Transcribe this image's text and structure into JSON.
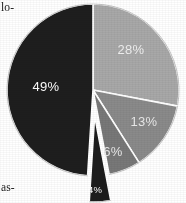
{
  "chart_data": {
    "type": "pie",
    "title": "",
    "subtitle": "",
    "xlabel": "",
    "ylabel": "",
    "legend": "none",
    "grid": false,
    "center": {
      "x": 93,
      "y": 90
    },
    "radius": 86,
    "start_angle_deg": 0,
    "direction": "clockwise",
    "labels": [
      "28%",
      "13%",
      "6%",
      "4%",
      "49%"
    ],
    "values": [
      28,
      13,
      6,
      4,
      49
    ],
    "categories": [
      "28%",
      "13%",
      "6%",
      "4%",
      "49%"
    ],
    "slices": [
      {
        "label": "28%",
        "value": 28,
        "color": "#a8a8a8",
        "label_color": "#efefef",
        "exploded": false,
        "label_x": 131,
        "label_y": 54
      },
      {
        "label": "13%",
        "value": 13,
        "color": "#8a8a8a",
        "label_color": "#e8e8e8",
        "exploded": false,
        "label_x": 144,
        "label_y": 126
      },
      {
        "label": "6%",
        "value": 6,
        "color": "#787878",
        "label_color": "#e8e8e8",
        "exploded": false,
        "label_x": 113,
        "label_y": 156
      },
      {
        "label": "4%",
        "value": 4,
        "color": "#1c1c1c",
        "label_color": "#ffffff",
        "exploded": true,
        "label_x": 95,
        "label_y": 193
      },
      {
        "label": "49%",
        "value": 49,
        "color": "#1e1e1e",
        "label_color": "#ffffff",
        "exploded": false,
        "label_x": 46,
        "label_y": 91
      }
    ]
  },
  "page_text": {
    "top_left_fragment": "lo-",
    "bottom_left_fragment": "as-"
  },
  "colors": {
    "background": "#ffffff",
    "separator": "#ffffff",
    "outline": "#b4b4b4",
    "slice_light": "#a8a8a8",
    "slice_medium": "#8a8a8a",
    "slice_dark_gray": "#787878",
    "slice_black": "#1e1e1e"
  }
}
